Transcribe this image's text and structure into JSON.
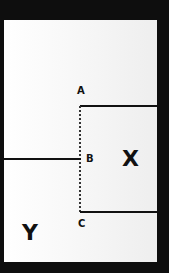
{
  "diagram": {
    "points": {
      "a": "A",
      "b": "B",
      "c": "C"
    },
    "regions": {
      "x": "X",
      "y": "Y"
    },
    "colors": {
      "background": "#0e0e0e",
      "panel": "#ffffff",
      "ink": "#111111"
    }
  }
}
